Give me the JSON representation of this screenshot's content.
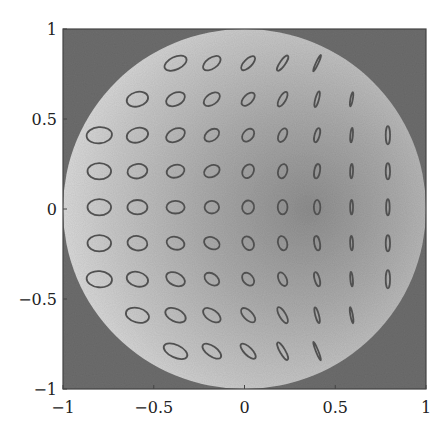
{
  "chart_data": {
    "type": "scatter",
    "title": "",
    "xlabel": "",
    "ylabel": "",
    "xlim": [
      -1,
      1
    ],
    "ylim": [
      -1,
      1
    ],
    "grid": false,
    "legend": null,
    "x_ticks": [
      {
        "value": -1,
        "label": "−1"
      },
      {
        "value": -0.5,
        "label": "−0.5"
      },
      {
        "value": 0,
        "label": "0"
      },
      {
        "value": 0.5,
        "label": "0.5"
      },
      {
        "value": 1,
        "label": "1"
      }
    ],
    "y_ticks": [
      {
        "value": 1,
        "label": "1"
      },
      {
        "value": 0.5,
        "label": "0.5"
      },
      {
        "value": 0,
        "label": "0"
      },
      {
        "value": -0.5,
        "label": "−0.5"
      },
      {
        "value": -1,
        "label": "−1"
      }
    ],
    "background": {
      "description": "Grayscale image: dark gray square field with a bright disk of radius 1 centered at origin; disk shading darkens toward the right-center",
      "outside_color": "#6e6e6e",
      "disk_edge_color": "#d8d8d8",
      "disk_center_color": "#c2c2c2",
      "disk_dark_color": "#8f8f8f",
      "disk_radius": 1.0
    },
    "ellipse_color": "#555555",
    "ellipses": [
      {
        "x": -0.38,
        "y": 0.81,
        "rx": 0.065,
        "ry": 0.035,
        "angle": -25
      },
      {
        "x": -0.18,
        "y": 0.81,
        "rx": 0.055,
        "ry": 0.03,
        "angle": -35
      },
      {
        "x": 0.02,
        "y": 0.81,
        "rx": 0.05,
        "ry": 0.022,
        "angle": -45
      },
      {
        "x": 0.21,
        "y": 0.81,
        "rx": 0.05,
        "ry": 0.015,
        "angle": -55
      },
      {
        "x": 0.4,
        "y": 0.81,
        "rx": 0.05,
        "ry": 0.005,
        "angle": -65
      },
      {
        "x": -0.59,
        "y": 0.61,
        "rx": 0.06,
        "ry": 0.04,
        "angle": -15
      },
      {
        "x": -0.38,
        "y": 0.61,
        "rx": 0.055,
        "ry": 0.035,
        "angle": -25
      },
      {
        "x": -0.18,
        "y": 0.61,
        "rx": 0.05,
        "ry": 0.03,
        "angle": -35
      },
      {
        "x": 0.02,
        "y": 0.61,
        "rx": 0.045,
        "ry": 0.025,
        "angle": -45
      },
      {
        "x": 0.21,
        "y": 0.61,
        "rx": 0.045,
        "ry": 0.018,
        "angle": -60
      },
      {
        "x": 0.4,
        "y": 0.61,
        "rx": 0.045,
        "ry": 0.01,
        "angle": -75
      },
      {
        "x": 0.59,
        "y": 0.61,
        "rx": 0.04,
        "ry": 0.006,
        "angle": -80
      },
      {
        "x": -0.8,
        "y": 0.41,
        "rx": 0.07,
        "ry": 0.045,
        "angle": -5
      },
      {
        "x": -0.59,
        "y": 0.41,
        "rx": 0.06,
        "ry": 0.04,
        "angle": -15
      },
      {
        "x": -0.38,
        "y": 0.41,
        "rx": 0.055,
        "ry": 0.035,
        "angle": -25
      },
      {
        "x": -0.18,
        "y": 0.41,
        "rx": 0.045,
        "ry": 0.03,
        "angle": -35
      },
      {
        "x": 0.02,
        "y": 0.41,
        "rx": 0.04,
        "ry": 0.028,
        "angle": -50
      },
      {
        "x": 0.21,
        "y": 0.41,
        "rx": 0.04,
        "ry": 0.022,
        "angle": -65
      },
      {
        "x": 0.4,
        "y": 0.41,
        "rx": 0.04,
        "ry": 0.014,
        "angle": -75
      },
      {
        "x": 0.59,
        "y": 0.41,
        "rx": 0.04,
        "ry": 0.007,
        "angle": -85
      },
      {
        "x": 0.79,
        "y": 0.41,
        "rx": 0.05,
        "ry": 0.012,
        "angle": -90
      },
      {
        "x": -0.8,
        "y": 0.21,
        "rx": 0.065,
        "ry": 0.045,
        "angle": 0
      },
      {
        "x": -0.59,
        "y": 0.21,
        "rx": 0.055,
        "ry": 0.04,
        "angle": -8
      },
      {
        "x": -0.38,
        "y": 0.21,
        "rx": 0.05,
        "ry": 0.035,
        "angle": -15
      },
      {
        "x": -0.18,
        "y": 0.21,
        "rx": 0.045,
        "ry": 0.032,
        "angle": -25
      },
      {
        "x": 0.02,
        "y": 0.21,
        "rx": 0.04,
        "ry": 0.03,
        "angle": -60
      },
      {
        "x": 0.21,
        "y": 0.21,
        "rx": 0.04,
        "ry": 0.025,
        "angle": -75
      },
      {
        "x": 0.4,
        "y": 0.21,
        "rx": 0.04,
        "ry": 0.016,
        "angle": -80
      },
      {
        "x": 0.59,
        "y": 0.21,
        "rx": 0.04,
        "ry": 0.008,
        "angle": -88
      },
      {
        "x": 0.79,
        "y": 0.21,
        "rx": 0.045,
        "ry": 0.012,
        "angle": -90
      },
      {
        "x": -0.8,
        "y": 0.01,
        "rx": 0.065,
        "ry": 0.045,
        "angle": 0
      },
      {
        "x": -0.59,
        "y": 0.01,
        "rx": 0.055,
        "ry": 0.04,
        "angle": 0
      },
      {
        "x": -0.38,
        "y": 0.01,
        "rx": 0.05,
        "ry": 0.035,
        "angle": 0
      },
      {
        "x": -0.18,
        "y": 0.01,
        "rx": 0.04,
        "ry": 0.035,
        "angle": 0
      },
      {
        "x": 0.02,
        "y": 0.01,
        "rx": 0.037,
        "ry": 0.033,
        "angle": -80
      },
      {
        "x": 0.21,
        "y": 0.01,
        "rx": 0.04,
        "ry": 0.027,
        "angle": -90
      },
      {
        "x": 0.4,
        "y": 0.01,
        "rx": 0.04,
        "ry": 0.018,
        "angle": -90
      },
      {
        "x": 0.59,
        "y": 0.01,
        "rx": 0.04,
        "ry": 0.008,
        "angle": -90
      },
      {
        "x": 0.79,
        "y": 0.01,
        "rx": 0.045,
        "ry": 0.01,
        "angle": -90
      },
      {
        "x": -0.8,
        "y": -0.19,
        "rx": 0.065,
        "ry": 0.045,
        "angle": 0
      },
      {
        "x": -0.59,
        "y": -0.19,
        "rx": 0.055,
        "ry": 0.04,
        "angle": 8
      },
      {
        "x": -0.38,
        "y": -0.19,
        "rx": 0.05,
        "ry": 0.035,
        "angle": 15
      },
      {
        "x": -0.18,
        "y": -0.19,
        "rx": 0.045,
        "ry": 0.032,
        "angle": 25
      },
      {
        "x": 0.02,
        "y": -0.19,
        "rx": 0.04,
        "ry": 0.03,
        "angle": 60
      },
      {
        "x": 0.21,
        "y": -0.19,
        "rx": 0.04,
        "ry": 0.025,
        "angle": 75
      },
      {
        "x": 0.4,
        "y": -0.19,
        "rx": 0.04,
        "ry": 0.016,
        "angle": 80
      },
      {
        "x": 0.59,
        "y": -0.19,
        "rx": 0.04,
        "ry": 0.008,
        "angle": 88
      },
      {
        "x": 0.79,
        "y": -0.19,
        "rx": 0.045,
        "ry": 0.012,
        "angle": 90
      },
      {
        "x": -0.8,
        "y": -0.39,
        "rx": 0.07,
        "ry": 0.045,
        "angle": 5
      },
      {
        "x": -0.59,
        "y": -0.39,
        "rx": 0.06,
        "ry": 0.04,
        "angle": 15
      },
      {
        "x": -0.38,
        "y": -0.39,
        "rx": 0.055,
        "ry": 0.035,
        "angle": 25
      },
      {
        "x": -0.18,
        "y": -0.39,
        "rx": 0.045,
        "ry": 0.03,
        "angle": 35
      },
      {
        "x": 0.02,
        "y": -0.39,
        "rx": 0.04,
        "ry": 0.028,
        "angle": 50
      },
      {
        "x": 0.21,
        "y": -0.39,
        "rx": 0.04,
        "ry": 0.022,
        "angle": 65
      },
      {
        "x": 0.4,
        "y": -0.39,
        "rx": 0.04,
        "ry": 0.014,
        "angle": 75
      },
      {
        "x": 0.59,
        "y": -0.39,
        "rx": 0.04,
        "ry": 0.007,
        "angle": 85
      },
      {
        "x": 0.79,
        "y": -0.39,
        "rx": 0.05,
        "ry": 0.012,
        "angle": 90
      },
      {
        "x": -0.59,
        "y": -0.59,
        "rx": 0.065,
        "ry": 0.04,
        "angle": 15
      },
      {
        "x": -0.38,
        "y": -0.59,
        "rx": 0.06,
        "ry": 0.035,
        "angle": 25
      },
      {
        "x": -0.18,
        "y": -0.59,
        "rx": 0.055,
        "ry": 0.03,
        "angle": 35
      },
      {
        "x": 0.02,
        "y": -0.59,
        "rx": 0.05,
        "ry": 0.025,
        "angle": 45
      },
      {
        "x": 0.21,
        "y": -0.59,
        "rx": 0.05,
        "ry": 0.018,
        "angle": 60
      },
      {
        "x": 0.4,
        "y": -0.59,
        "rx": 0.045,
        "ry": 0.01,
        "angle": 75
      },
      {
        "x": 0.59,
        "y": -0.59,
        "rx": 0.045,
        "ry": 0.006,
        "angle": 80
      },
      {
        "x": -0.38,
        "y": -0.79,
        "rx": 0.07,
        "ry": 0.035,
        "angle": 25
      },
      {
        "x": -0.18,
        "y": -0.79,
        "rx": 0.06,
        "ry": 0.028,
        "angle": 35
      },
      {
        "x": 0.02,
        "y": -0.79,
        "rx": 0.055,
        "ry": 0.022,
        "angle": 45
      },
      {
        "x": 0.21,
        "y": -0.79,
        "rx": 0.055,
        "ry": 0.015,
        "angle": 60
      },
      {
        "x": 0.4,
        "y": -0.79,
        "rx": 0.055,
        "ry": 0.005,
        "angle": 68
      }
    ]
  },
  "layout": {
    "plot_left": 63,
    "plot_top": 29,
    "plot_right": 426,
    "plot_bottom": 389
  }
}
